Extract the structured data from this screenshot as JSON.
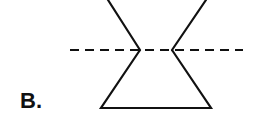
{
  "figure": {
    "label": "B.",
    "stroke_color": "#111111",
    "background": "#ffffff",
    "dashed_line": {
      "x1": 70,
      "y1": 50,
      "x2": 243,
      "y2": 50,
      "dash": "9,6"
    },
    "upper_left_line": {
      "x1": 108,
      "y1": 0,
      "x2": 140,
      "y2": 50
    },
    "upper_right_line": {
      "x1": 206,
      "y1": 0,
      "x2": 172,
      "y2": 50
    },
    "lower_trapezoid": {
      "points": "140,50 172,50 211,108 101,108"
    }
  }
}
